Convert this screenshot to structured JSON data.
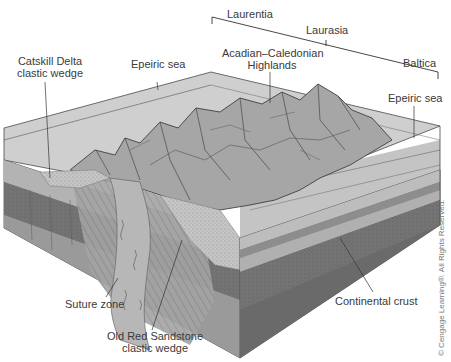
{
  "diagram": {
    "type": "block-diagram",
    "plates": {
      "laurentia": "Laurentia",
      "laurasia": "Laurasia",
      "baltica": "Baltica"
    },
    "labels": {
      "catskill_line1": "Catskill Delta",
      "catskill_line2": "clastic wedge",
      "epeiric_sea_left": "Epeiric sea",
      "highlands_line1": "Acadian–Caledonian",
      "highlands_line2": "Highlands",
      "epeiric_sea_right": "Epeiric sea",
      "suture_zone": "Suture zone",
      "old_red_line1": "Old Red Sandstone",
      "old_red_line2": "clastic wedge",
      "continental_crust": "Continental crust"
    },
    "copyright": "© Cengage Learning®. All Rights Reserved.",
    "colors": {
      "sea": "#c9c9c9",
      "top_surface": "#bdbdbd",
      "mountains": "#9a9a9a",
      "upper_strata": "#b0b0b0",
      "middle_strata": "#7c7c7c",
      "lower_crust": "#8d8d8d",
      "right_face_dark": "#6e6e6e",
      "outline": "#4a4a4a",
      "leader": "#333333"
    }
  }
}
